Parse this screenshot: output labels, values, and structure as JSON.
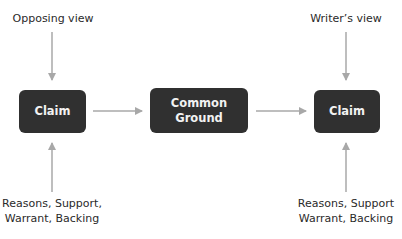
{
  "nodes": {
    "opposing_view": "Opposing view",
    "writers_view": "Writer’s view",
    "claim_left": "Claim",
    "common_ground_line1": "Common",
    "common_ground_line2": "Ground",
    "claim_right": "Claim",
    "support_left_line1": "Reasons, Support,",
    "support_left_line2": "Warrant, Backing",
    "support_right_line1": "Reasons, Support",
    "support_right_line2": "Warrant, Backing"
  },
  "colors": {
    "box": "#303030",
    "box_text": "#f2f2f2",
    "arrow": "#a8a8a8",
    "label_text": "#2a2a2a"
  }
}
